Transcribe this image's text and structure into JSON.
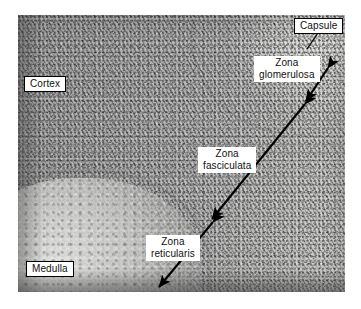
{
  "figure": {
    "kind": "light-micrograph",
    "background_color": "#ffffff",
    "plate": {
      "left": 18,
      "top": 15,
      "width": 327,
      "height": 277,
      "tint": "grayscale"
    }
  },
  "labels": {
    "capsule": {
      "text": "Capsule",
      "boxed": true,
      "lines": 1
    },
    "cortex": {
      "text": "Cortex",
      "boxed": true,
      "lines": 1
    },
    "medulla": {
      "text": "Medulla",
      "boxed": true,
      "lines": 1
    },
    "glomerulosa": {
      "text": "Zona\nglomerulosa",
      "boxed": false,
      "lines": 2
    },
    "fasciculata": {
      "text": "Zona\nfasciculata",
      "boxed": false,
      "lines": 2
    },
    "reticularis": {
      "text": "Zona\nreticularis",
      "boxed": false,
      "lines": 2
    }
  },
  "annotations": {
    "stroke_color": "#000000",
    "leaders": [
      {
        "name": "capsule-leader",
        "type": "line",
        "x1": 318,
        "y1": 33,
        "x2": 307,
        "y2": 49
      }
    ],
    "span_arrows": [
      {
        "name": "zona-glomerulosa-span",
        "type": "double-arrow",
        "x1": 328,
        "y1": 68,
        "x2": 306,
        "y2": 101
      },
      {
        "name": "zona-fasciculata-span",
        "type": "double-arrow",
        "x1": 305,
        "y1": 103,
        "x2": 212,
        "y2": 219
      },
      {
        "name": "zona-reticularis-span",
        "type": "double-arrow",
        "x1": 213,
        "y1": 222,
        "x2": 159,
        "y2": 287
      }
    ],
    "label_leaders": [
      {
        "name": "fasciculata-leader",
        "type": "line",
        "x1": 248,
        "y1": 170,
        "x2": 262,
        "y2": 152
      },
      {
        "name": "reticularis-leader",
        "type": "line",
        "x1": 196,
        "y1": 246,
        "x2": 183,
        "y2": 246
      }
    ]
  }
}
